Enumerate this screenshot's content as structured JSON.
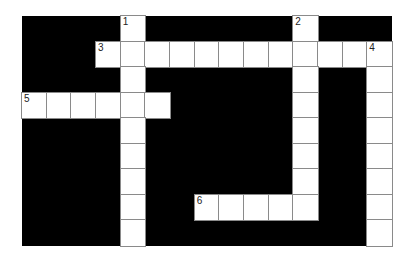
{
  "puzzle": {
    "rows": 9,
    "cols": 15,
    "colors": {
      "block": "#000000",
      "cell": "#ffffff",
      "line": "#8a8a8a"
    },
    "entries": [
      {
        "number": "1",
        "direction": "down",
        "row": 0,
        "col": 4,
        "length": 9
      },
      {
        "number": "2",
        "direction": "down",
        "row": 0,
        "col": 11,
        "length": 8
      },
      {
        "number": "3",
        "direction": "across",
        "row": 1,
        "col": 3,
        "length": 12
      },
      {
        "number": "4",
        "direction": "down",
        "row": 1,
        "col": 14,
        "length": 8
      },
      {
        "number": "5",
        "direction": "across",
        "row": 3,
        "col": 0,
        "length": 6
      },
      {
        "number": "6",
        "direction": "across",
        "row": 7,
        "col": 7,
        "length": 5
      }
    ]
  }
}
